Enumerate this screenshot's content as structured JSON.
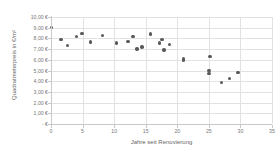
{
  "chart_data": {
    "type": "scatter",
    "title": "",
    "xlabel": "Jahre seit Renovierung",
    "ylabel": "Quadratmeterpreis  in €/m²",
    "xlim": [
      0,
      35
    ],
    "ylim": [
      0,
      10
    ],
    "grid": true,
    "legend": false,
    "marker_color": "#595959",
    "x_ticklabels": [
      "0",
      "5",
      "10",
      "15",
      "20",
      "25",
      "30",
      "35"
    ],
    "x_tickvalues": [
      0,
      5,
      10,
      15,
      20,
      25,
      30,
      35
    ],
    "y_ticklabels": [
      "10,00 €",
      "9,00 €",
      "8,00 €",
      "7,00 €",
      "6,00 €",
      "5,00 €",
      "4,00 €",
      "3,00 €",
      "2,00 €",
      "1,00 €",
      "- €"
    ],
    "y_tickvalues": [
      10,
      9,
      8,
      7,
      6,
      5,
      4,
      3,
      2,
      1,
      0
    ],
    "points": [
      {
        "x": 0.1,
        "y": 9.0
      },
      {
        "x": 1.6,
        "y": 7.92
      },
      {
        "x": 2.6,
        "y": 7.32
      },
      {
        "x": 4.0,
        "y": 8.18
      },
      {
        "x": 4.9,
        "y": 8.45
      },
      {
        "x": 6.3,
        "y": 7.68
      },
      {
        "x": 8.2,
        "y": 8.3
      },
      {
        "x": 10.4,
        "y": 7.58
      },
      {
        "x": 12.2,
        "y": 7.72
      },
      {
        "x": 13.0,
        "y": 8.2
      },
      {
        "x": 13.6,
        "y": 7.02
      },
      {
        "x": 14.4,
        "y": 7.2
      },
      {
        "x": 15.8,
        "y": 8.42
      },
      {
        "x": 17.2,
        "y": 7.58
      },
      {
        "x": 17.6,
        "y": 7.92
      },
      {
        "x": 17.9,
        "y": 6.92
      },
      {
        "x": 18.8,
        "y": 7.42
      },
      {
        "x": 21.0,
        "y": 6.1
      },
      {
        "x": 21.0,
        "y": 6.0
      },
      {
        "x": 25.2,
        "y": 6.3
      },
      {
        "x": 25.0,
        "y": 5.0
      },
      {
        "x": 25.0,
        "y": 4.7
      },
      {
        "x": 27.0,
        "y": 3.9
      },
      {
        "x": 28.3,
        "y": 4.25
      },
      {
        "x": 29.6,
        "y": 4.8
      }
    ]
  }
}
